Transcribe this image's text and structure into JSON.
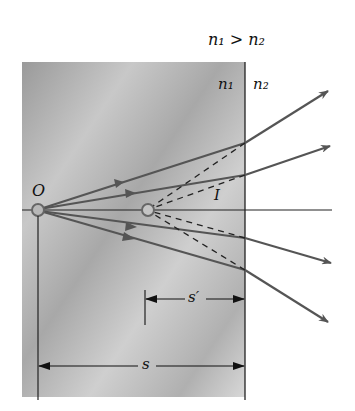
{
  "labels": {
    "condition": "n₁ > n₂",
    "medium1": "n₁",
    "medium2": "n₂",
    "object": "O",
    "image": "I",
    "image_distance": "s′",
    "object_distance": "s"
  },
  "colors": {
    "medium_fill": "#b5b5b5",
    "ray": "#555555",
    "line": "#222222"
  }
}
